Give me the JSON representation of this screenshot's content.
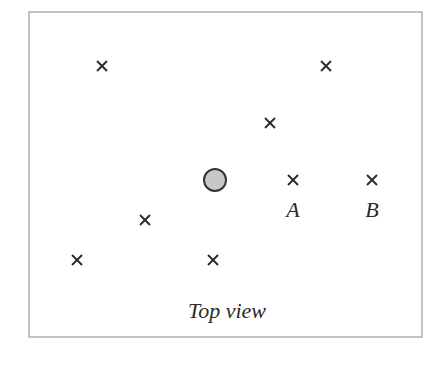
{
  "diagram": {
    "caption": "Top view",
    "frame": {
      "x": 29,
      "y": 12,
      "width": 393,
      "height": 325,
      "stroke": "#9a9a9a"
    },
    "central_object": {
      "shape": "circle",
      "cx": 215,
      "cy": 180,
      "r": 11,
      "fill": "#c8c8c8",
      "stroke": "#333333"
    },
    "crosses": [
      {
        "x": 102,
        "y": 66,
        "label": ""
      },
      {
        "x": 326,
        "y": 66,
        "label": ""
      },
      {
        "x": 270,
        "y": 123,
        "label": ""
      },
      {
        "x": 293,
        "y": 180,
        "label": "A"
      },
      {
        "x": 372,
        "y": 180,
        "label": "B"
      },
      {
        "x": 145,
        "y": 220,
        "label": ""
      },
      {
        "x": 77,
        "y": 260,
        "label": ""
      },
      {
        "x": 213,
        "y": 260,
        "label": ""
      }
    ],
    "labels": {
      "a": "A",
      "b": "B"
    },
    "cross_icon": "x-mark-icon",
    "cross_size": 10
  }
}
